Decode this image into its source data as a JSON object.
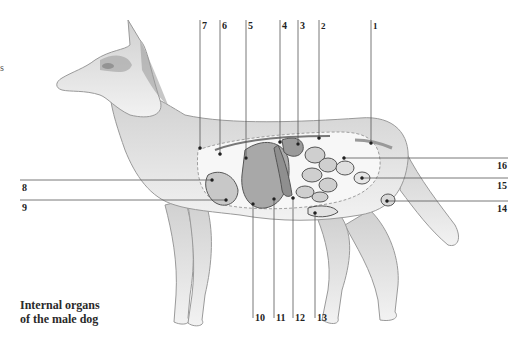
{
  "edge_fragment": "s",
  "caption": {
    "line1": "Internal organs",
    "line2": "of the male dog"
  },
  "labels": {
    "top": [
      {
        "num": "7",
        "x": 200,
        "lineTop": 20,
        "pointY": 148
      },
      {
        "num": "6",
        "x": 220,
        "lineTop": 20,
        "pointY": 154
      },
      {
        "num": "5",
        "x": 246,
        "lineTop": 20,
        "pointY": 158
      },
      {
        "num": "4",
        "x": 280,
        "lineTop": 20,
        "pointY": 142
      },
      {
        "num": "3",
        "x": 298,
        "lineTop": 20,
        "pointY": 144
      },
      {
        "num": "2",
        "x": 319,
        "lineTop": 20,
        "pointY": 138
      },
      {
        "num": "1",
        "x": 371,
        "lineTop": 20,
        "pointY": 143
      }
    ],
    "left": [
      {
        "num": "8",
        "y": 181,
        "lineRight": 212,
        "pointX": 212
      },
      {
        "num": "9",
        "y": 201,
        "lineRight": 226,
        "pointX": 226
      }
    ],
    "right": [
      {
        "num": "16",
        "y": 158,
        "lineLeft": 344,
        "pointX": 344
      },
      {
        "num": "15",
        "y": 178,
        "lineLeft": 362,
        "pointX": 362
      },
      {
        "num": "14",
        "y": 201,
        "lineLeft": 387,
        "pointX": 387
      }
    ],
    "bottom": [
      {
        "num": "10",
        "x": 253,
        "pointY": 204
      },
      {
        "num": "11",
        "x": 274,
        "pointY": 199
      },
      {
        "num": "12",
        "x": 293,
        "pointY": 198
      },
      {
        "num": "13",
        "x": 315,
        "pointY": 213
      }
    ]
  },
  "colors": {
    "line": "#555555",
    "body_fill": "#e9e9e9",
    "body_stroke": "#9a9a9a",
    "organ_fill": "#b8b8b8",
    "organ_stroke": "#555555",
    "dark_fur": "#8a8a8a"
  }
}
